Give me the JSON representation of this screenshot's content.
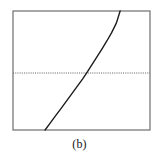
{
  "figure": {
    "caption": "(b)",
    "background_color": "#ffffff"
  },
  "chart_data": {
    "type": "line",
    "title": "",
    "subtitle": "",
    "caption": "(b)",
    "xlabel": "",
    "ylabel": "",
    "xticklabels": [],
    "yticklabels": [],
    "grid": false,
    "legend": null,
    "legend_position": "none",
    "frame": {
      "visible": true,
      "color": "#6e6e6e",
      "line_width": 1.2,
      "left_px": 13,
      "right_px": 150,
      "top_px": 11,
      "bottom_px": 130
    },
    "xlim": [
      0,
      1
    ],
    "ylim": [
      0,
      1
    ],
    "series": [
      {
        "name": "curve",
        "style": "solid",
        "color": "#1c1c1c",
        "line_width": 1.4,
        "comment": "monotonic increasing convex-then-slightly-linear curve, drawn in normalized axes coordinates (0-1 of the frame box)",
        "x": [
          0.234,
          0.27,
          0.31,
          0.35,
          0.39,
          0.43,
          0.47,
          0.51,
          0.545,
          0.58,
          0.615,
          0.65,
          0.685,
          0.72,
          0.755,
          0.782
        ],
        "y": [
          0.0,
          0.055,
          0.118,
          0.18,
          0.243,
          0.305,
          0.368,
          0.432,
          0.492,
          0.555,
          0.618,
          0.682,
          0.748,
          0.818,
          0.9,
          1.0
        ]
      }
    ],
    "reference_lines": [
      {
        "name": "horizontal-reference",
        "orientation": "horizontal",
        "style": "dotted",
        "color": "#6e6e6e",
        "line_width": 1.0,
        "y_normalized": 0.52,
        "y_px": 73,
        "x_start_px": 13,
        "x_end_px": 150
      }
    ],
    "annotations": [],
    "crossings": [
      {
        "name": "curve-reference-crossing",
        "x_px": 86,
        "y_px": 73
      }
    ]
  }
}
